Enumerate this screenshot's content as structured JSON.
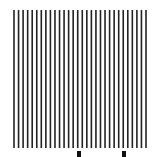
{
  "figure": {
    "background": "#ffffff",
    "line_color": "#222222",
    "grating": {
      "line_count": 30,
      "x_start": 14,
      "x_end": 146,
      "y_top": 10,
      "y_bottom": 148,
      "line_width": 1.6
    },
    "markers": [
      {
        "name": "left-marker",
        "x": 77,
        "y": 151,
        "width": 4,
        "height": 6,
        "color": "#111111"
      },
      {
        "name": "right-marker",
        "x": 122,
        "y": 151,
        "width": 4,
        "height": 6,
        "color": "#111111"
      }
    ]
  }
}
